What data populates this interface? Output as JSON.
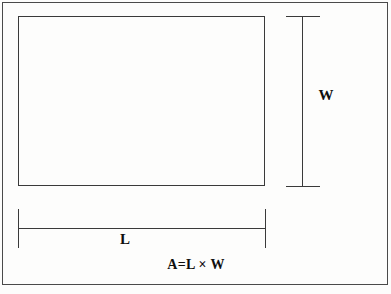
{
  "figure": {
    "kind": "geometry-diagram",
    "background_color": "#fdfdfc",
    "line_color": "#3a3a3a",
    "frame_color": "#4a4a4a",
    "text_color": "#0f0f0f"
  },
  "labels": {
    "width": "W",
    "length": "L",
    "formula": "A=L × W"
  },
  "chart_data": {
    "type": "diagram",
    "title": "",
    "shape": "rectangle",
    "annotations": [
      {
        "name": "width-dimension",
        "text": "W",
        "orientation": "vertical"
      },
      {
        "name": "length-dimension",
        "text": "L",
        "orientation": "horizontal"
      },
      {
        "name": "area-formula",
        "text": "A=L × W",
        "orientation": "horizontal"
      }
    ]
  }
}
